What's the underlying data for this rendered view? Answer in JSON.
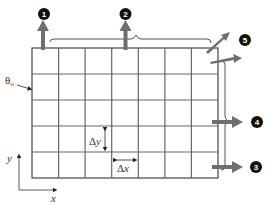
{
  "diagram": {
    "type": "finite-difference grid",
    "grid": {
      "columns": 7,
      "rows": 5
    },
    "labels": {
      "theta0": "θ",
      "theta0_sub": "o",
      "dy": "Δy",
      "dx": "Δx",
      "axis_x": "x",
      "axis_y": "y"
    },
    "callouts": [
      {
        "id": "1",
        "label": "1"
      },
      {
        "id": "2",
        "label": "2"
      },
      {
        "id": "3",
        "label": "3"
      },
      {
        "id": "4",
        "label": "4"
      },
      {
        "id": "5",
        "label": "5"
      }
    ],
    "colors": {
      "grid": "#666666",
      "arrow": "#6e6e6e",
      "badge": "#111111"
    }
  }
}
